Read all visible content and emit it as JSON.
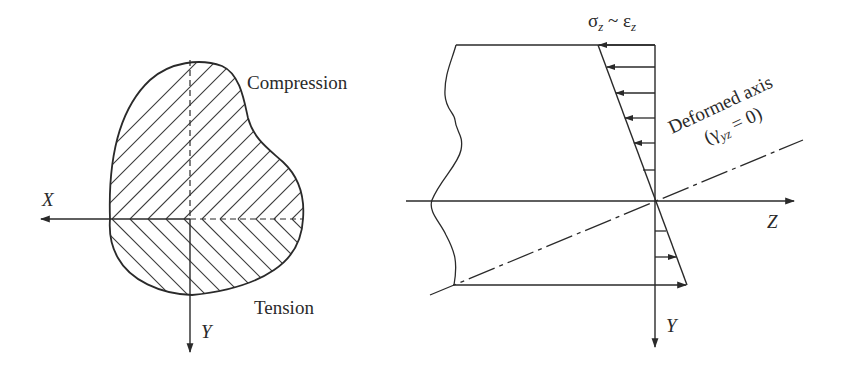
{
  "figure": {
    "left_panel": {
      "title": "Cross-section",
      "labels": {
        "compression": "Compression",
        "tension": "Tension",
        "x_axis": "X",
        "y_axis": "Y"
      }
    },
    "right_panel": {
      "title": "Side view",
      "labels": {
        "stress_strain": "σ",
        "stress_sub": "z",
        "tilde": " ~ ε",
        "strain_sub": "z",
        "deformed_axis": "Deformed axis",
        "shear_open": "(γ",
        "shear_sub": "yz",
        "shear_close": " = 0)",
        "z_axis": "Z",
        "y_axis": "Y"
      }
    },
    "colors": {
      "ink": "#2a2a2a",
      "background": "#ffffff"
    }
  }
}
